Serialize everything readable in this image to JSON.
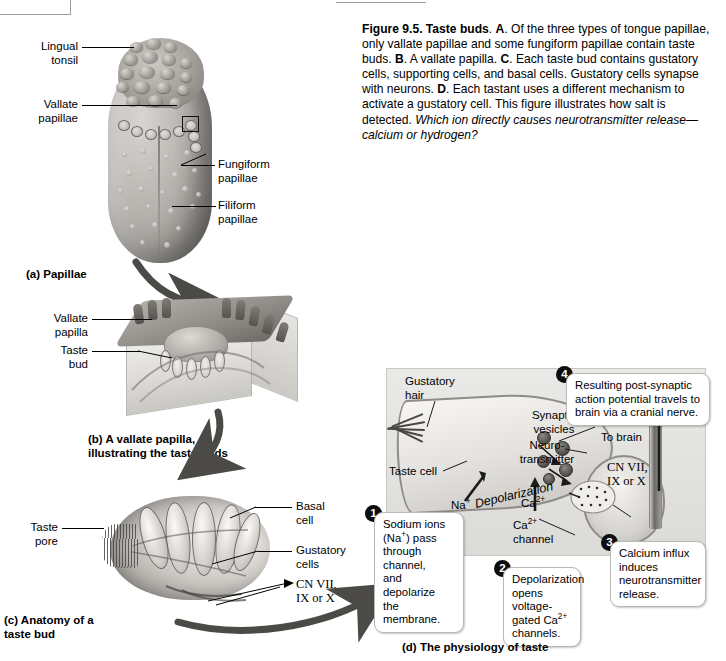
{
  "figure": {
    "number": "Figure 9.5.",
    "title": "Taste buds",
    "caption_html": "<b>Figure 9.5. Taste buds</b>. <b>A</b>. Of the three types of tongue papillae, only vallate papillae and some fungiform papillae contain taste buds. <b>B</b>. A vallate papilla. <b>C</b>. Each taste bud contains gustatory cells, supporting cells, and basal cells. Gustatory cells synapse with neurons. <b>D</b>. Each tastant uses a different mechanism to activate a gustatory cell. This figure illustrates how salt is detected. <i>Which ion directly causes neurotransmitter release—calcium or hydrogen?</i>"
  },
  "panel_a": {
    "caption": "(a) Papillae",
    "labels": [
      {
        "id": "lingual-tonsil",
        "text": "Lingual\ntonsil"
      },
      {
        "id": "vallate-papillae",
        "text": "Vallate\npapillae"
      },
      {
        "id": "fungiform-papillae",
        "text": "Fungiform\npapillae"
      },
      {
        "id": "filiform-papillae",
        "text": "Filiform\npapillae"
      }
    ]
  },
  "panel_b": {
    "caption": "(b) A vallate papilla,\n    illustrating the taste buds",
    "labels": [
      {
        "id": "vallate-papilla",
        "text": "Vallate\npapilla"
      },
      {
        "id": "taste-bud",
        "text": "Taste\nbud"
      }
    ]
  },
  "panel_c": {
    "caption": "(c) Anatomy of a\n     taste bud",
    "labels": [
      {
        "id": "taste-pore",
        "text": "Taste\npore"
      },
      {
        "id": "basal-cell",
        "text": "Basal\ncell"
      },
      {
        "id": "gustatory-cells",
        "text": "Gustatory\ncells"
      },
      {
        "id": "cranial-nerves",
        "text": "CN VII,\nIX or X"
      }
    ]
  },
  "panel_d": {
    "caption": "(d) The physiology of taste",
    "labels": [
      {
        "id": "gustatory-hair",
        "text": "Gustatory\nhair"
      },
      {
        "id": "taste-cell",
        "text": "Taste cell"
      },
      {
        "id": "synaptic-vesicles",
        "text": "Synaptic\nvesicles"
      },
      {
        "id": "neurotransmitter",
        "text": "Neuro-\ntransmitter"
      },
      {
        "id": "to-brain",
        "text": "To brain"
      },
      {
        "id": "cranial-nerves",
        "text": "CN VII,\nIX or X"
      },
      {
        "id": "calcium-channel",
        "text": "Ca2+\nchannel"
      }
    ],
    "ions": {
      "sodium": "Na+",
      "calcium": "Ca2+"
    },
    "depolarization_label": "Depolarization",
    "steps": [
      {
        "num": "1",
        "text": "Sodium ions (Na+) pass through channel, and depolarize the membrane."
      },
      {
        "num": "2",
        "text": "Depolarization opens voltage-gated Ca2+ channels."
      },
      {
        "num": "3",
        "text": "Calcium influx induces neurotransmitter release."
      },
      {
        "num": "4",
        "text": "Resulting post-synaptic action potential travels to brain via a cranial nerve."
      }
    ]
  },
  "colors": {
    "background": "#ffffff",
    "text": "#000000",
    "panel_d_background": "#e4e3e0",
    "callout_border": "#b9b8b5",
    "step_badge": "#0d0d0d"
  }
}
